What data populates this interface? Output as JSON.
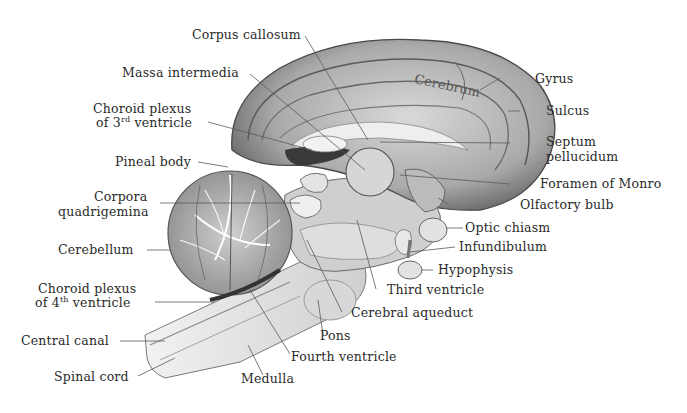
{
  "figure": {
    "overlay_label": "Cerebrum",
    "colors": {
      "background": "#ffffff",
      "tissue_light": "#e6e6e6",
      "tissue_mid": "#bdbdbd",
      "tissue_dark": "#6e6e6e",
      "outline": "#4a4a4a",
      "leader_line": "#5a5a5a",
      "text": "#2a2a2a"
    }
  },
  "labels_left": [
    {
      "id": "corpus-callosum",
      "text": "Corpus callosum"
    },
    {
      "id": "massa-intermedia",
      "text": "Massa intermedia"
    },
    {
      "id": "choroid-plexus-3rd-line1",
      "text": "Choroid plexus"
    },
    {
      "id": "choroid-plexus-3rd-line2-pre",
      "text": "of 3"
    },
    {
      "id": "choroid-plexus-3rd-sup",
      "text": "rd"
    },
    {
      "id": "choroid-plexus-3rd-line2-post",
      "text": " ventricle"
    },
    {
      "id": "pineal-body",
      "text": "Pineal body"
    },
    {
      "id": "corpora-quadrigemina-line1",
      "text": "Corpora"
    },
    {
      "id": "corpora-quadrigemina-line2",
      "text": "quadrigemina"
    },
    {
      "id": "cerebellum",
      "text": "Cerebellum"
    },
    {
      "id": "choroid-plexus-4th-line1",
      "text": "Choroid plexus"
    },
    {
      "id": "choroid-plexus-4th-line2-pre",
      "text": "of 4"
    },
    {
      "id": "choroid-plexus-4th-sup",
      "text": "th"
    },
    {
      "id": "choroid-plexus-4th-line2-post",
      "text": " ventricle"
    },
    {
      "id": "central-canal",
      "text": "Central canal"
    },
    {
      "id": "spinal-cord",
      "text": "Spinal cord"
    }
  ],
  "labels_right": [
    {
      "id": "gyrus",
      "text": "Gyrus"
    },
    {
      "id": "sulcus",
      "text": "Sulcus"
    },
    {
      "id": "septum-pellucidum-line1",
      "text": "Septum"
    },
    {
      "id": "septum-pellucidum-line2",
      "text": "pellucidum"
    },
    {
      "id": "foramen-of-monro",
      "text": "Foramen of Monro"
    },
    {
      "id": "olfactory-bulb",
      "text": "Olfactory bulb"
    },
    {
      "id": "optic-chiasm",
      "text": "Optic chiasm"
    },
    {
      "id": "infundibulum",
      "text": "Infundibulum"
    },
    {
      "id": "hypophysis",
      "text": "Hypophysis"
    }
  ],
  "labels_bottom": [
    {
      "id": "third-ventricle",
      "text": "Third ventricle"
    },
    {
      "id": "cerebral-aqueduct",
      "text": "Cerebral aqueduct"
    },
    {
      "id": "pons",
      "text": "Pons"
    },
    {
      "id": "fourth-ventricle",
      "text": "Fourth ventricle"
    },
    {
      "id": "medulla",
      "text": "Medulla"
    }
  ]
}
